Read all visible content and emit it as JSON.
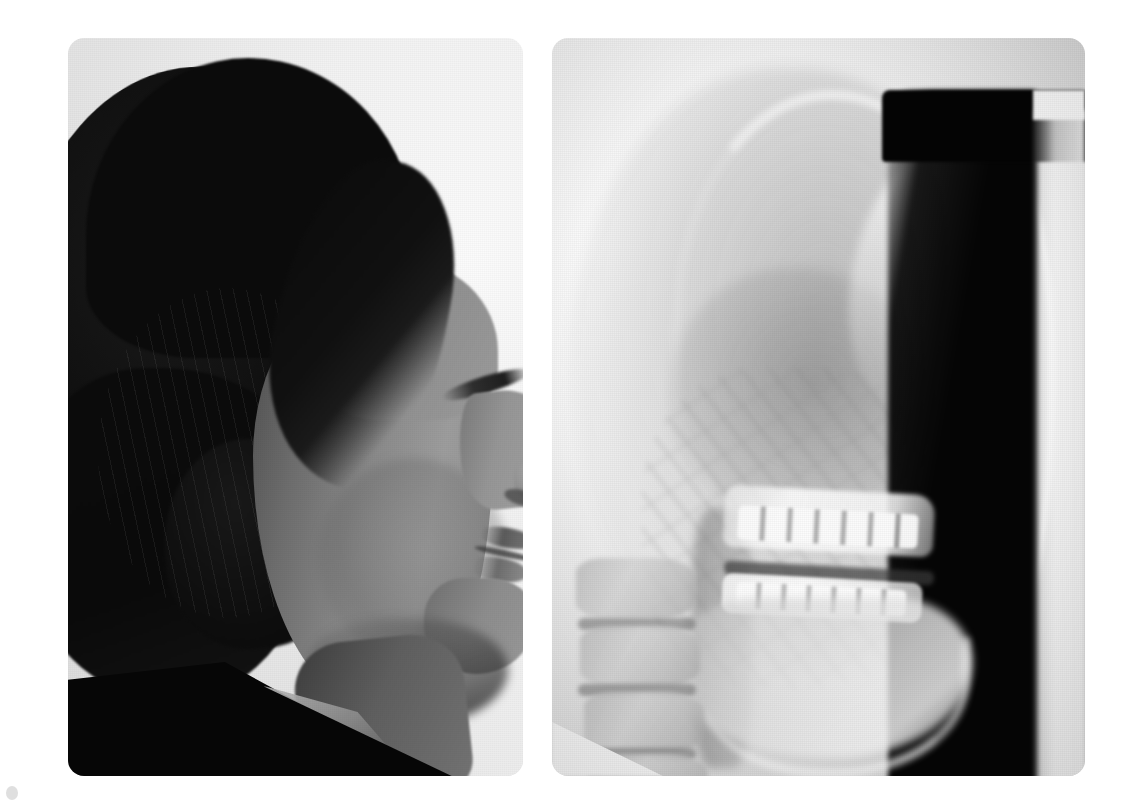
{
  "figure": {
    "background_color": "#ffffff",
    "width": 1138,
    "height": 806,
    "panel_count": 2,
    "layout": "two-panel side-by-side",
    "page_mark_label": ""
  },
  "panels": [
    {
      "id": "profile-photograph",
      "type": "photograph",
      "modality": "clinical photograph",
      "view": "lateral / right profile",
      "subject": "adolescent female",
      "description": "Black-and-white lateral profile photograph of a young female with dark shoulder-length hair, facing right, wearing dark clothing with a white shirt collar visible at the neck.",
      "visible_features": [
        "dark hair mass",
        "forehead",
        "brow",
        "eye with lashes",
        "nose",
        "nostril",
        "upper lip",
        "lower lip",
        "chin",
        "jawline",
        "neck",
        "dark collar",
        "white shirt"
      ],
      "credit_text": "",
      "corner_radius_px": 16,
      "bounds": {
        "x": 68,
        "y": 38,
        "width": 455,
        "height": 738
      }
    },
    {
      "id": "cephalometric-radiograph",
      "type": "radiograph",
      "modality": "lateral cephalometric radiograph",
      "view": "lateral / right profile",
      "description": "Lateral cephalometric X-ray of the same subject showing cranial vault, soft-tissue facial profile, maxilla with upper incisors, mandible with lower incisors, occlusal plane and cervical vertebrae.",
      "visible_features": [
        "cranial vault outline",
        "frontal and nasal bone ridge",
        "soft-tissue facial profile line",
        "maxilla",
        "upper incisors",
        "occlusal plane",
        "mandible body",
        "lower incisors",
        "mandibular border",
        "cervical vertebrae",
        "pharyngeal airway shadow",
        "film edge strip",
        "black air/background column"
      ],
      "corner_radius_px": 16,
      "bounds": {
        "x": 552,
        "y": 38,
        "width": 533,
        "height": 738
      }
    }
  ],
  "colors": {
    "page_background": "#ffffff",
    "photo_background": "#ededed",
    "photo_shadow": "#060606",
    "photo_skin_mid": "#8a8a8a",
    "film_background": "#e8e8e8",
    "film_bone_bright": "#fafafa",
    "film_air_black": "#050505",
    "film_soft_tissue": "#b0b0b0"
  }
}
